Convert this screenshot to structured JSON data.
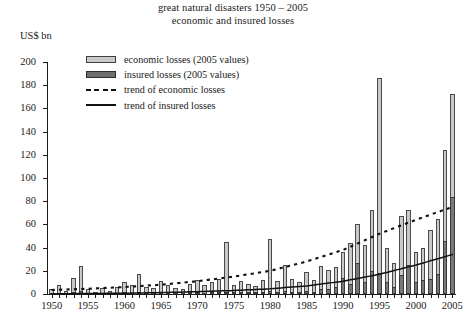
{
  "chart_data": {
    "type": "bar",
    "title": "great natural disasters 1950 – 2005",
    "subtitle": "economic and insured losses",
    "ylabel": "US$ bn",
    "xlabel": "",
    "ylim": [
      0,
      200
    ],
    "yticks": [
      0,
      20,
      40,
      60,
      80,
      100,
      120,
      140,
      160,
      180,
      200
    ],
    "xlim": [
      1950,
      2005
    ],
    "xticks": [
      1950,
      1955,
      1960,
      1965,
      1970,
      1975,
      1980,
      1985,
      1990,
      1995,
      2000,
      2005
    ],
    "grid": false,
    "legend_position": "upper-left-inside",
    "legend": [
      "economic losses (2005 values)",
      "insured losses (2005 values)",
      "trend of economic losses",
      "trend of insured losses"
    ],
    "colors": {
      "economic": "#c9c9c9",
      "insured": "#787878",
      "axis": "#1a1a1a",
      "trend": "#111111"
    },
    "categories": [
      1950,
      1951,
      1952,
      1953,
      1954,
      1955,
      1956,
      1957,
      1958,
      1959,
      1960,
      1961,
      1962,
      1963,
      1964,
      1965,
      1966,
      1967,
      1968,
      1969,
      1970,
      1971,
      1972,
      1973,
      1974,
      1975,
      1976,
      1977,
      1978,
      1979,
      1980,
      1981,
      1982,
      1983,
      1984,
      1985,
      1986,
      1987,
      1988,
      1989,
      1990,
      1991,
      1992,
      1993,
      1994,
      1995,
      1996,
      1997,
      1998,
      1999,
      2000,
      2001,
      2002,
      2003,
      2004,
      2005
    ],
    "series": [
      {
        "name": "economic losses (2005 values)",
        "values": [
          4,
          8,
          3,
          14,
          24,
          4,
          2,
          5,
          3,
          6,
          10,
          8,
          17,
          6,
          5,
          11,
          8,
          5,
          4,
          9,
          12,
          8,
          10,
          13,
          45,
          8,
          11,
          9,
          7,
          12,
          47,
          11,
          25,
          13,
          10,
          19,
          12,
          24,
          21,
          23,
          36,
          44,
          60,
          42,
          72,
          186,
          40,
          27,
          67,
          72,
          36,
          40,
          55,
          65,
          124,
          172
        ]
      },
      {
        "name": "insured losses (2005 values)",
        "values": [
          0,
          0,
          0,
          1,
          3,
          0,
          0,
          0,
          0,
          0,
          1,
          0,
          2,
          0,
          0,
          1,
          0,
          0,
          0,
          1,
          1,
          0,
          1,
          1,
          2,
          1,
          1,
          1,
          1,
          2,
          3,
          2,
          3,
          2,
          2,
          3,
          2,
          4,
          4,
          6,
          14,
          9,
          27,
          10,
          20,
          18,
          10,
          6,
          16,
          25,
          10,
          12,
          13,
          17,
          46,
          84
        ]
      }
    ],
    "trend_economic": {
      "label": "trend of economic losses",
      "style": "dotted",
      "x": [
        1950,
        1955,
        1960,
        1965,
        1970,
        1975,
        1980,
        1985,
        1990,
        1995,
        2000,
        2005
      ],
      "y": [
        3.5,
        4.5,
        6,
        8,
        11,
        15,
        20,
        28,
        38,
        52,
        64,
        75
      ]
    },
    "trend_insured": {
      "label": "trend of insured losses",
      "style": "solid",
      "x": [
        1950,
        1955,
        1960,
        1965,
        1970,
        1975,
        1980,
        1985,
        1990,
        1995,
        2000,
        2005
      ],
      "y": [
        0.2,
        0.4,
        0.7,
        1.2,
        2,
        3,
        4.5,
        7,
        11,
        17,
        25,
        34
      ]
    }
  }
}
